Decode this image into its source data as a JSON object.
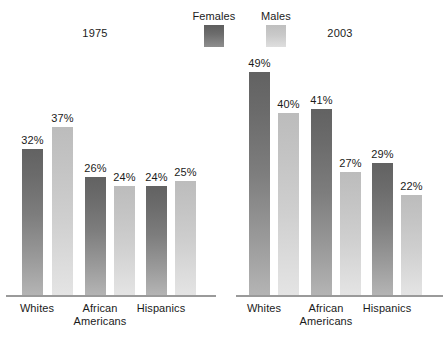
{
  "legend": {
    "items": [
      {
        "label": "Females",
        "color": "#6b6b6b",
        "key": "females"
      },
      {
        "label": "Males",
        "color": "#c9c9c9",
        "key": "males"
      }
    ]
  },
  "panels": [
    {
      "heading": "1975"
    },
    {
      "heading": "2003"
    }
  ],
  "categories": [
    {
      "line1": "Whites",
      "line2": ""
    },
    {
      "line1": "African",
      "line2": "Americans"
    },
    {
      "line1": "Hispanics",
      "line2": ""
    }
  ],
  "bars": {
    "p0": [
      {
        "value": "32%",
        "num": 32
      },
      {
        "value": "37%",
        "num": 37
      },
      {
        "value": "26%",
        "num": 26
      },
      {
        "value": "24%",
        "num": 24
      },
      {
        "value": "24%",
        "num": 24
      },
      {
        "value": "25%",
        "num": 25
      }
    ],
    "p1": [
      {
        "value": "49%",
        "num": 49
      },
      {
        "value": "40%",
        "num": 40
      },
      {
        "value": "41%",
        "num": 41
      },
      {
        "value": "27%",
        "num": 27
      },
      {
        "value": "29%",
        "num": 29
      },
      {
        "value": "22%",
        "num": 22
      }
    ]
  },
  "chart_data": {
    "type": "bar",
    "title": "",
    "subtitle": "",
    "xlabel": "",
    "ylabel": "",
    "grid": false,
    "legend_position": "top-center",
    "value_suffix": "%",
    "ylim": [
      0,
      52
    ],
    "px_per_unit": 4.55,
    "baseline_y_px": 295,
    "panels": [
      {
        "heading": "1975",
        "categories": [
          "Whites",
          "African Americans",
          "Hispanics"
        ],
        "series": [
          {
            "name": "Females",
            "values": [
              32,
              26,
              24
            ],
            "color": "#6b6b6b"
          },
          {
            "name": "Males",
            "values": [
              37,
              24,
              25
            ],
            "color": "#c9c9c9"
          }
        ]
      },
      {
        "heading": "2003",
        "categories": [
          "Whites",
          "African Americans",
          "Hispanics"
        ],
        "series": [
          {
            "name": "Females",
            "values": [
              49,
              41,
              29
            ],
            "color": "#6b6b6b"
          },
          {
            "name": "Males",
            "values": [
              40,
              27,
              22
            ],
            "color": "#c9c9c9"
          }
        ]
      }
    ],
    "data_labels": [
      "32%",
      "37%",
      "26%",
      "24%",
      "24%",
      "25%",
      "49%",
      "40%",
      "41%",
      "27%",
      "29%",
      "22%"
    ],
    "annotations": []
  }
}
